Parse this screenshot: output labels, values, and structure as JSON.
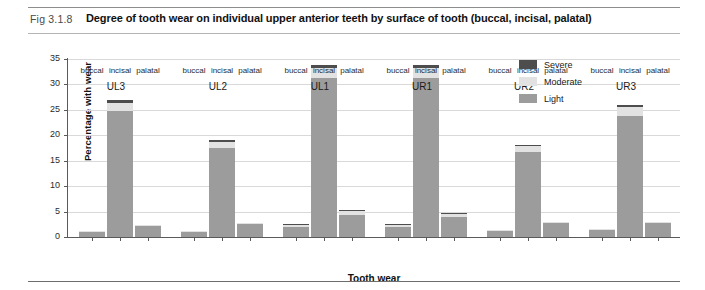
{
  "figure": {
    "number": "Fig 3.1.8",
    "title": "Degree of tooth wear on individual upper anterior teeth by surface of tooth (buccal, incisal, palatal)"
  },
  "legend": {
    "position": "top-right",
    "items": [
      {
        "label": "Severe",
        "color": "#4d4d4d"
      },
      {
        "label": "Moderate",
        "color": "#e2e2e2"
      },
      {
        "label": "Light",
        "color": "#9c9c9c"
      }
    ]
  },
  "axes": {
    "y": {
      "label": "Percentage with wear",
      "ticks": [
        "0",
        "5",
        "10",
        "15",
        "20",
        "25",
        "30",
        "35"
      ],
      "min": 0,
      "max": 35
    },
    "x": {
      "label": "Tooth wear",
      "groups": [
        "UL3",
        "UL2",
        "UL1",
        "UR1",
        "UR2",
        "UR3"
      ],
      "surfaces": [
        "buccal",
        "incisal",
        "palatal"
      ]
    }
  },
  "chart_data": {
    "type": "bar",
    "title": "Degree of tooth wear on individual upper anterior teeth by surface of tooth (buccal, incisal, palatal)",
    "xlabel": "Tooth wear",
    "ylabel": "Percentage with wear",
    "ylim": [
      0,
      35
    ],
    "ytick_step": 5,
    "grid": true,
    "stacked": true,
    "legend_position": "top-right",
    "series": [
      {
        "name": "Light",
        "color": "#9c9c9c"
      },
      {
        "name": "Moderate",
        "color": "#e2e2e2"
      },
      {
        "name": "Severe",
        "color": "#4d4d4d"
      }
    ],
    "groups": [
      {
        "name": "UL3",
        "bars": [
          {
            "surface": "buccal",
            "light": 0.9,
            "moderate": 0.1,
            "severe": 0.0,
            "total": 1.0
          },
          {
            "surface": "incisal",
            "light": 24.8,
            "moderate": 1.5,
            "severe": 0.7,
            "total": 27.0
          },
          {
            "surface": "palatal",
            "light": 2.2,
            "moderate": 0.2,
            "severe": 0.0,
            "total": 2.4
          }
        ]
      },
      {
        "name": "UL2",
        "bars": [
          {
            "surface": "buccal",
            "light": 0.9,
            "moderate": 0.1,
            "severe": 0.0,
            "total": 1.0
          },
          {
            "surface": "incisal",
            "light": 17.6,
            "moderate": 1.1,
            "severe": 0.3,
            "total": 19.0
          },
          {
            "surface": "palatal",
            "light": 2.5,
            "moderate": 0.3,
            "severe": 0.0,
            "total": 2.8
          }
        ]
      },
      {
        "name": "UL1",
        "bars": [
          {
            "surface": "buccal",
            "light": 2.0,
            "moderate": 0.3,
            "severe": 0.1,
            "total": 2.4
          },
          {
            "surface": "incisal",
            "light": 31.2,
            "moderate": 2.1,
            "severe": 0.6,
            "total": 33.9
          },
          {
            "surface": "palatal",
            "light": 4.4,
            "moderate": 0.7,
            "severe": 0.2,
            "total": 5.3
          }
        ]
      },
      {
        "name": "UR1",
        "bars": [
          {
            "surface": "buccal",
            "light": 2.0,
            "moderate": 0.3,
            "severe": 0.1,
            "total": 2.4
          },
          {
            "surface": "incisal",
            "light": 31.3,
            "moderate": 2.0,
            "severe": 0.6,
            "total": 33.9
          },
          {
            "surface": "palatal",
            "light": 3.9,
            "moderate": 0.6,
            "severe": 0.1,
            "total": 4.6
          }
        ]
      },
      {
        "name": "UR2",
        "bars": [
          {
            "surface": "buccal",
            "light": 1.2,
            "moderate": 0.2,
            "severe": 0.0,
            "total": 1.4
          },
          {
            "surface": "incisal",
            "light": 16.8,
            "moderate": 1.0,
            "severe": 0.3,
            "total": 18.1
          },
          {
            "surface": "palatal",
            "light": 2.7,
            "moderate": 0.3,
            "severe": 0.0,
            "total": 3.0
          }
        ]
      },
      {
        "name": "UR3",
        "bars": [
          {
            "surface": "buccal",
            "light": 1.3,
            "moderate": 0.2,
            "severe": 0.0,
            "total": 1.5
          },
          {
            "surface": "incisal",
            "light": 23.7,
            "moderate": 1.8,
            "severe": 0.5,
            "total": 26.0
          },
          {
            "surface": "palatal",
            "light": 2.7,
            "moderate": 0.3,
            "severe": 0.0,
            "total": 3.0
          }
        ]
      }
    ]
  }
}
